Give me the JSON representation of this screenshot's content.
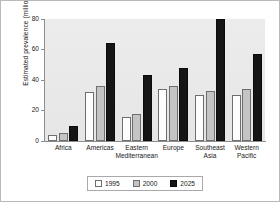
{
  "chart_data": {
    "type": "bar",
    "title": "",
    "xlabel": "",
    "ylabel": "Estimated prevalence (millions)",
    "ylim": [
      0,
      80
    ],
    "yticks": [
      0,
      20,
      40,
      60,
      80
    ],
    "ytick_labels": [
      "0",
      "20",
      "40",
      "60",
      "80"
    ],
    "grid": false,
    "legend_position": "bottom",
    "categories": [
      "Africa",
      "Americas",
      "Eastern\nMediterranean",
      "Europe",
      "Southeast\nAsia",
      "Western\nPacific"
    ],
    "series": [
      {
        "name": "1995",
        "color": "#fdfdfd",
        "values": [
          4,
          32,
          16,
          34,
          30,
          30
        ]
      },
      {
        "name": "2000",
        "color": "#c4c4c4",
        "values": [
          5,
          36,
          18,
          36,
          33,
          34
        ]
      },
      {
        "name": "2025",
        "color": "#151515",
        "values": [
          10,
          64,
          43,
          48,
          80,
          57
        ]
      }
    ]
  },
  "legend": {
    "items": [
      {
        "label": "1995",
        "swatch": "legend-swatch-1995"
      },
      {
        "label": "2000",
        "swatch": "legend-swatch-2000"
      },
      {
        "label": "2025",
        "swatch": "legend-swatch-2025"
      }
    ]
  }
}
